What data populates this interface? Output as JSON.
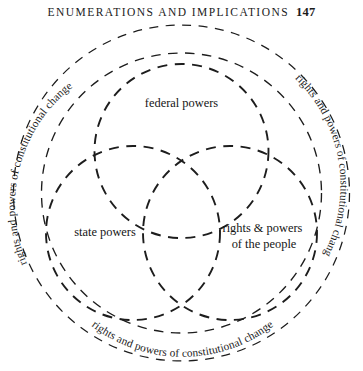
{
  "running_head": {
    "title": "ENUMERATIONS AND IMPLICATIONS",
    "page_number": "147"
  },
  "figure": {
    "name": "venn-diagram-of-constitutional-powers",
    "outer_ring_labels": {
      "left": "rights and powers of constitutional change",
      "right": "rights and powers of constitutional change",
      "bottom": "rights and powers of constitutional change"
    },
    "sets": [
      {
        "id": "federal",
        "label": "federal powers"
      },
      {
        "id": "state",
        "label": "state powers"
      },
      {
        "id": "people",
        "label_line1": "rights & powers",
        "label_line2": "of the people"
      }
    ],
    "colors": {
      "stroke": "#1d1d1d",
      "text": "#1b1b1b",
      "background": "#ffffff"
    }
  }
}
